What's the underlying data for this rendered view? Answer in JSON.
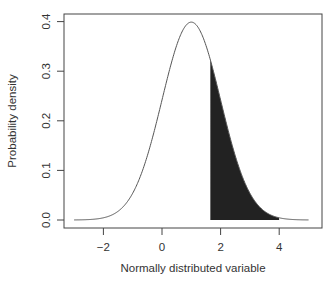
{
  "chart_data": {
    "type": "line",
    "title": "",
    "xlabel": "Normally distributed variable",
    "ylabel": "Probability density",
    "xlim": [
      -3,
      5
    ],
    "ylim": [
      0,
      0.4
    ],
    "x_ticks": [
      -2,
      0,
      2,
      4
    ],
    "x_tick_labels": [
      "−2",
      "0",
      "2",
      "4"
    ],
    "y_ticks": [
      0.0,
      0.1,
      0.2,
      0.3,
      0.4
    ],
    "y_tick_labels": [
      "0.0",
      "0.1",
      "0.2",
      "0.3",
      "0.4"
    ],
    "grid": false,
    "legend": null,
    "series": [
      {
        "name": "Normal density (mean 1, sd 1)",
        "distribution": {
          "mean": 1,
          "sd": 1
        },
        "x_range": [
          -3,
          5
        ],
        "color": "#555555",
        "peak": {
          "x": 1,
          "y": 0.399
        }
      }
    ],
    "shaded_region": {
      "from_x": 1.65,
      "to_x": 4,
      "color": "#222222",
      "description": "Upper tail area under the curve"
    }
  }
}
